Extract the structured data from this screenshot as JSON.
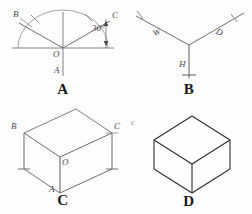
{
  "figure": {
    "background": "#fdfdfd",
    "ink_light": "#8a8a8a",
    "ink_mid": "#6d6d6d",
    "ink_dark": "#2b2b2b"
  },
  "panels": [
    {
      "id": "A",
      "caption": "A",
      "description": "Isometric axes laid out on a semicircular protractor with 30 degree angle marked",
      "labels": {
        "b": "B",
        "c": "C",
        "o": "O",
        "a": "A",
        "angle": "30°"
      }
    },
    {
      "id": "B",
      "caption": "B",
      "description": "Three isometric axes with width, depth and height measured off",
      "labels": {
        "w": "W",
        "d": "D",
        "h": "H"
      }
    },
    {
      "id": "C",
      "caption": "C",
      "description": "Isometric box blocked in from the measured axes",
      "labels": {
        "b": "B",
        "c": "C",
        "o": "O",
        "a": "A"
      }
    },
    {
      "id": "D",
      "caption": "D",
      "description": "Completed isometric box with construction lines removed",
      "labels": {
        "stray": "c"
      }
    }
  ]
}
